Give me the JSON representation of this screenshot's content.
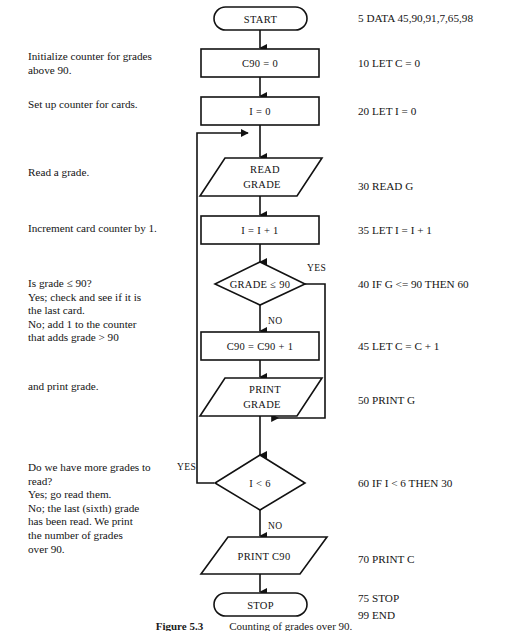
{
  "figure": {
    "caption_label": "Figure 5.3",
    "caption_text": "Counting of grades over 90."
  },
  "flowchart": {
    "nodes": [
      {
        "id": "start",
        "type": "terminator",
        "label": "START"
      },
      {
        "id": "c90init",
        "type": "process",
        "label": "C90 = 0"
      },
      {
        "id": "iinit",
        "type": "process",
        "label": "I = 0"
      },
      {
        "id": "readgrade",
        "type": "input-output",
        "label_line1": "READ",
        "label_line2": "GRADE"
      },
      {
        "id": "incri",
        "type": "process",
        "label": "I = I + 1"
      },
      {
        "id": "gradetest",
        "type": "decision",
        "label": "GRADE ≤ 90"
      },
      {
        "id": "c90incr",
        "type": "process",
        "label": "C90 = C90 + 1"
      },
      {
        "id": "printgrade",
        "type": "input-output",
        "label_line1": "PRINT",
        "label_line2": "GRADE"
      },
      {
        "id": "loopstest",
        "type": "decision",
        "label": "I < 6"
      },
      {
        "id": "printc90",
        "type": "input-output",
        "label": "PRINT C90"
      },
      {
        "id": "stop",
        "type": "terminator",
        "label": "STOP"
      }
    ],
    "branch_labels": {
      "grade_yes": "YES",
      "grade_no": "NO",
      "loop_yes": "YES",
      "loop_no": "NO"
    }
  },
  "left_notes": [
    {
      "id": "note-init-counter",
      "text": "Initialize counter for grades\n   above 90."
    },
    {
      "id": "note-card-counter",
      "text": "Set up counter for cards."
    },
    {
      "id": "note-read-grade",
      "text": "Read a grade."
    },
    {
      "id": "note-increment",
      "text": "Increment card counter by 1."
    },
    {
      "id": "note-grade-test",
      "text": "Is grade ≤ 90?\n   Yes; check and see if it is\n      the last card.\n   No; add 1 to the counter\n      that adds grade > 90"
    },
    {
      "id": "note-print-grade",
      "text": "   and print grade."
    },
    {
      "id": "note-more-grades",
      "text": "Do we have more grades to\nread?\n   Yes; go read them.\n   No; the last (sixth) grade\n      has been read. We print\n      the number of grades\n      over 90."
    }
  ],
  "right_code": [
    {
      "id": "line-5",
      "text": "5 DATA 45,90,91,7,65,98"
    },
    {
      "id": "line-10",
      "text": "10 LET C = 0"
    },
    {
      "id": "line-20",
      "text": "20 LET I = 0"
    },
    {
      "id": "line-30",
      "text": "30 READ G"
    },
    {
      "id": "line-35",
      "text": "35 LET I = I + 1"
    },
    {
      "id": "line-40",
      "text": "40 IF G <= 90 THEN 60"
    },
    {
      "id": "line-45",
      "text": "45 LET C = C + 1"
    },
    {
      "id": "line-50",
      "text": "50 PRINT G"
    },
    {
      "id": "line-60",
      "text": "60 IF I < 6 THEN 30"
    },
    {
      "id": "line-70",
      "text": "70 PRINT C"
    },
    {
      "id": "line-75",
      "text": "75 STOP"
    },
    {
      "id": "line-99",
      "text": "99 END"
    }
  ]
}
